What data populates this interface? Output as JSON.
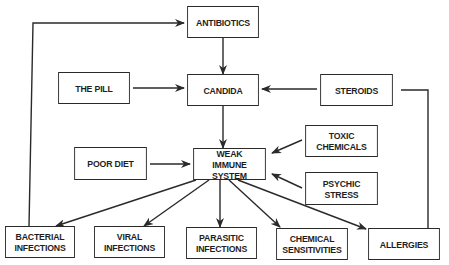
{
  "diagram": {
    "colors": {
      "line": "#2a2a2a",
      "text": "#1e1e1e",
      "background": "#ffffff"
    },
    "nodes": {
      "antibiotics": {
        "lines": [
          "ANTIBIOTICS"
        ],
        "box": [
          184,
          6,
          78,
          32
        ]
      },
      "the_pill": {
        "lines": [
          "THE PILL"
        ],
        "box": [
          55,
          72,
          78,
          32
        ]
      },
      "candida": {
        "lines": [
          "CANDIDA"
        ],
        "box": [
          184,
          74,
          78,
          32
        ]
      },
      "steroids": {
        "lines": [
          "STEROIDS"
        ],
        "box": [
          317,
          74,
          79,
          32
        ]
      },
      "toxic_chemicals": {
        "lines": [
          "TOXIC",
          "CHEMICALS"
        ],
        "box": [
          302,
          125,
          79,
          32
        ]
      },
      "poor_diet": {
        "lines": [
          "POOR DIET"
        ],
        "box": [
          71,
          147,
          79,
          33
        ]
      },
      "weak_immune_system": {
        "lines": [
          "WEAK",
          "IMMUNE SYSTEM"
        ],
        "box": [
          190,
          148,
          79,
          32
        ]
      },
      "psychic_stress": {
        "lines": [
          "PSYCHIC",
          "STRESS"
        ],
        "box": [
          302,
          172,
          79,
          33
        ]
      },
      "bacterial_infections": {
        "lines": [
          "BACTERIAL",
          "INFECTIONS"
        ],
        "box": [
          2,
          226,
          76,
          32
        ]
      },
      "viral_infections": {
        "lines": [
          "VIRAL",
          "INFECTIONS"
        ],
        "box": [
          91,
          226,
          77,
          32
        ]
      },
      "parasitic_infections": {
        "lines": [
          "PARASITIC",
          "INFECTIONS"
        ],
        "box": [
          183,
          227,
          77,
          32
        ]
      },
      "chemical_sensitivities": {
        "lines": [
          "CHEMICAL",
          "SENSITIVITIES"
        ],
        "box": [
          273,
          228,
          78,
          32
        ]
      },
      "allergies": {
        "lines": [
          "ALLERGIES"
        ],
        "box": [
          365,
          228,
          78,
          32
        ]
      }
    },
    "edges": [
      {
        "from": "antibiotics",
        "to": "candida",
        "points": [
          [
            223,
            38
          ],
          [
            223,
            74
          ]
        ],
        "arrow": true
      },
      {
        "from": "the_pill",
        "to": "candida",
        "points": [
          [
            133,
            88
          ],
          [
            184,
            88
          ]
        ],
        "arrow": true
      },
      {
        "from": "steroids",
        "to": "candida",
        "points": [
          [
            317,
            89
          ],
          [
            262,
            89
          ]
        ],
        "arrow": true
      },
      {
        "from": "candida",
        "to": "weak_immune_system",
        "points": [
          [
            223,
            106
          ],
          [
            223,
            148
          ]
        ],
        "arrow": true
      },
      {
        "from": "poor_diet",
        "to": "weak_immune_system",
        "points": [
          [
            150,
            164
          ],
          [
            190,
            164
          ]
        ],
        "arrow": true
      },
      {
        "from": "toxic_chemicals",
        "to": "weak_immune_system",
        "points": [
          [
            302,
            140
          ],
          [
            272,
            153
          ]
        ],
        "arrow": true
      },
      {
        "from": "psychic_stress",
        "to": "weak_immune_system",
        "points": [
          [
            302,
            188
          ],
          [
            272,
            174
          ]
        ],
        "arrow": true
      },
      {
        "from": "weak_immune_system",
        "to": "bacterial_infections",
        "points": [
          [
            196,
            180
          ],
          [
            56,
            226
          ]
        ],
        "arrow": true
      },
      {
        "from": "weak_immune_system",
        "to": "viral_infections",
        "points": [
          [
            209,
            180
          ],
          [
            144,
            226
          ]
        ],
        "arrow": true
      },
      {
        "from": "weak_immune_system",
        "to": "parasitic_infections",
        "points": [
          [
            220,
            180
          ],
          [
            220,
            227
          ]
        ],
        "arrow": true
      },
      {
        "from": "weak_immune_system",
        "to": "chemical_sensitivities",
        "points": [
          [
            229,
            180
          ],
          [
            280,
            227
          ]
        ],
        "arrow": true
      },
      {
        "from": "weak_immune_system",
        "to": "allergies",
        "points": [
          [
            238,
            180
          ],
          [
            366,
            229
          ]
        ],
        "arrow": true
      },
      {
        "from": "bacterial_infections",
        "to": "antibiotics",
        "points": [
          [
            29,
            226
          ],
          [
            33,
            23
          ],
          [
            184,
            23
          ]
        ],
        "arrow": true
      },
      {
        "from": "allergies",
        "to": "steroids",
        "points": [
          [
            428,
            228
          ],
          [
            428,
            90
          ],
          [
            401,
            90
          ]
        ],
        "arrow": false
      }
    ]
  }
}
